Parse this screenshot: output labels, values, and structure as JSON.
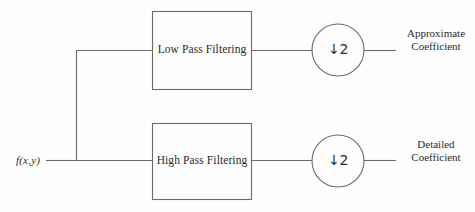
{
  "diagram": {
    "input": {
      "label": "f(x,y)",
      "name": "input-signal"
    },
    "branches": [
      {
        "id": "approximate",
        "filter_label": "Low Pass Filtering",
        "downsampler_label": "↓2",
        "downsampler_arrow": "↓",
        "downsampler_factor": "2",
        "output_label_line1": "Approximate",
        "output_label_line2": "Coefficient"
      },
      {
        "id": "detailed",
        "filter_label": "High Pass Filtering",
        "downsampler_label": "↓2",
        "downsampler_arrow": "↓",
        "downsampler_factor": "2",
        "output_label_line1": "Detailed",
        "output_label_line2": "Coefficient"
      }
    ],
    "colors": {
      "stroke": "#6a6a6a",
      "text": "#2b2b2b",
      "background": "#fefefe",
      "shape_fill": "#fdfdfd"
    }
  }
}
